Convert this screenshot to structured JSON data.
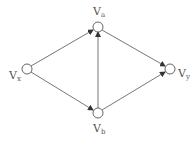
{
  "diagram": {
    "type": "directed-graph",
    "nodes": [
      {
        "id": "vx",
        "label": "V",
        "sub": "x",
        "cx": 27,
        "cy": 69
      },
      {
        "id": "va",
        "label": "V",
        "sub": "a",
        "cx": 98,
        "cy": 27
      },
      {
        "id": "vb",
        "label": "V",
        "sub": "b",
        "cx": 98,
        "cy": 113
      },
      {
        "id": "vy",
        "label": "V",
        "sub": "y",
        "cx": 170,
        "cy": 69
      }
    ],
    "edges": [
      {
        "from": "vx",
        "to": "va"
      },
      {
        "from": "vx",
        "to": "vb"
      },
      {
        "from": "vb",
        "to": "va"
      },
      {
        "from": "va",
        "to": "vy"
      },
      {
        "from": "vb",
        "to": "vy"
      }
    ],
    "colors": {
      "edge": "#555555",
      "node_stroke": "#555555",
      "node_fill": "#ffffff",
      "label": "#555555"
    }
  }
}
